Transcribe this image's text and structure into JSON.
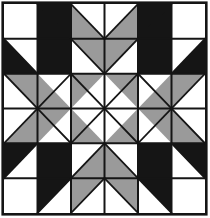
{
  "figure": {
    "kind": "geometric-quilt-block",
    "grid_rows": 6,
    "grid_cols": 6
  },
  "canvas": {
    "width": 210,
    "height": 218,
    "background": "#ffffff"
  },
  "palette": {
    "black": "#151515",
    "gray": "#9a9a9a",
    "white": "#ffffff",
    "line": "#151515"
  },
  "layout": {
    "origin_x": 4,
    "origin_y": 4,
    "block_width": 201,
    "block_height": 209,
    "cell_width": 33.5,
    "cell_height": 34.833,
    "outer_border_width": 2.6,
    "grid_line_width": 2.0,
    "diagonal_line_width": 1.8
  },
  "cells": [
    [
      {
        "name": "r0c0",
        "fill": "white",
        "shape": "solid"
      },
      {
        "name": "r0c1",
        "fill": "black",
        "shape": "half-tl-br",
        "primary": "black",
        "secondary": "white",
        "note": "diagonal top-left to bottom-right, black lower-left"
      },
      {
        "name": "r0c2",
        "fill": "gray",
        "shape": "half-tl-br",
        "primary": "gray",
        "secondary": "white",
        "note": "gray upper-left triangle"
      },
      {
        "name": "r0c3",
        "fill": "gray",
        "shape": "half-tr-bl",
        "primary": "gray",
        "secondary": "white",
        "note": "gray upper-right triangle"
      },
      {
        "name": "r0c4",
        "fill": "black",
        "shape": "half-tr-bl",
        "primary": "black",
        "secondary": "white",
        "note": "diagonal top-right to bottom-left, black lower-right"
      },
      {
        "name": "r0c5",
        "fill": "white",
        "shape": "solid"
      }
    ],
    [
      {
        "name": "r1c0",
        "fill": "black",
        "shape": "half-tl-br",
        "primary": "white",
        "secondary": "black",
        "note": "black lower-right triangle"
      },
      {
        "name": "r1c1",
        "fill": "black",
        "shape": "solid"
      },
      {
        "name": "r1c2",
        "fill": "white",
        "shape": "half-tr-bl",
        "primary": "white",
        "secondary": "gray",
        "note": "gray lower-right triangle"
      },
      {
        "name": "r1c3",
        "fill": "white",
        "shape": "half-tl-br",
        "primary": "white",
        "secondary": "gray",
        "note": "gray lower-left triangle"
      },
      {
        "name": "r1c4",
        "fill": "black",
        "shape": "solid"
      },
      {
        "name": "r1c5",
        "fill": "black",
        "shape": "half-tr-bl",
        "primary": "white",
        "secondary": "black",
        "note": "black lower-left triangle"
      }
    ],
    [
      {
        "name": "r2c0",
        "fill": "gray",
        "shape": "half-tl-br",
        "primary": "gray",
        "secondary": "white",
        "note": "gray upper-left triangle"
      },
      {
        "name": "r2c1",
        "fill": "gray",
        "shape": "half-tr-bl",
        "primary": "gray",
        "secondary": "white",
        "note": "gray upper-right and lower-left"
      },
      {
        "name": "r2c2",
        "fill": "white",
        "shape": "half-tr-bl",
        "primary": "gray",
        "secondary": "white",
        "note": "gray upper-left wedge"
      },
      {
        "name": "r2c3",
        "fill": "white",
        "shape": "half-tl-br",
        "primary": "gray",
        "secondary": "white",
        "note": "gray upper-right wedge"
      },
      {
        "name": "r2c4",
        "fill": "gray",
        "shape": "half-tl-br",
        "primary": "gray",
        "secondary": "white"
      },
      {
        "name": "r2c5",
        "fill": "gray",
        "shape": "half-tr-bl",
        "primary": "gray",
        "secondary": "white"
      }
    ],
    [
      {
        "name": "r3c0",
        "fill": "gray",
        "shape": "half-tr-bl",
        "primary": "gray",
        "secondary": "white"
      },
      {
        "name": "r3c1",
        "fill": "gray",
        "shape": "half-tl-br",
        "primary": "gray",
        "secondary": "white"
      },
      {
        "name": "r3c2",
        "fill": "white",
        "shape": "half-tl-br",
        "primary": "gray",
        "secondary": "white"
      },
      {
        "name": "r3c3",
        "fill": "white",
        "shape": "half-tr-bl",
        "primary": "gray",
        "secondary": "white"
      },
      {
        "name": "r3c4",
        "fill": "gray",
        "shape": "half-tr-bl",
        "primary": "gray",
        "secondary": "white"
      },
      {
        "name": "r3c5",
        "fill": "gray",
        "shape": "half-tl-br",
        "primary": "gray",
        "secondary": "white"
      }
    ],
    [
      {
        "name": "r4c0",
        "fill": "black",
        "shape": "half-tr-bl",
        "primary": "white",
        "secondary": "black"
      },
      {
        "name": "r4c1",
        "fill": "black",
        "shape": "solid"
      },
      {
        "name": "r4c2",
        "fill": "white",
        "shape": "half-tl-br",
        "primary": "white",
        "secondary": "gray"
      },
      {
        "name": "r4c3",
        "fill": "white",
        "shape": "half-tr-bl",
        "primary": "white",
        "secondary": "gray"
      },
      {
        "name": "r4c4",
        "fill": "black",
        "shape": "solid"
      },
      {
        "name": "r4c5",
        "fill": "black",
        "shape": "half-tl-br",
        "primary": "white",
        "secondary": "black"
      }
    ],
    [
      {
        "name": "r5c0",
        "fill": "white",
        "shape": "solid"
      },
      {
        "name": "r5c1",
        "fill": "black",
        "shape": "half-tr-bl",
        "primary": "black",
        "secondary": "white"
      },
      {
        "name": "r5c2",
        "fill": "gray",
        "shape": "half-tr-bl",
        "primary": "gray",
        "secondary": "white"
      },
      {
        "name": "r5c3",
        "fill": "gray",
        "shape": "half-tl-br",
        "primary": "gray",
        "secondary": "white"
      },
      {
        "name": "r5c4",
        "fill": "black",
        "shape": "half-tl-br",
        "primary": "black",
        "secondary": "white"
      },
      {
        "name": "r5c5",
        "fill": "white",
        "shape": "solid"
      }
    ]
  ],
  "shapes": {
    "note": "Explicit polygon list in block-local coordinates (0..6 cell units). Filled regions only; white is the background.",
    "black_regions": [
      {
        "name": "tl-star-arm-upper",
        "points": "1,0 2,0 2,1 1,1"
      },
      {
        "name": "tl-star-arm-upper-cut",
        "points": "1,0 2,1 1,1"
      },
      {
        "name": "tl-block-square",
        "points": "1,1 2,1 2,2 1,2"
      },
      {
        "name": "tl-star-arm-left",
        "points": "0,1 1,2 0,2"
      },
      {
        "name": "tr-star-arm-upper",
        "points": "4,0 5,0 5,1 4,1"
      },
      {
        "name": "tr-block-square",
        "points": "4,1 5,1 5,2 4,2"
      },
      {
        "name": "tr-star-arm-right",
        "points": "5,2 6,1 6,2"
      },
      {
        "name": "bl-star-arm-left",
        "points": "0,4 1,4 0,5"
      },
      {
        "name": "bl-block-square",
        "points": "1,4 2,4 2,5 1,5"
      },
      {
        "name": "bl-star-arm-lower",
        "points": "1,5 2,5 1,6"
      },
      {
        "name": "br-block-square",
        "points": "4,4 5,4 5,5 4,5"
      },
      {
        "name": "br-star-arm-right",
        "points": "5,4 6,4 6,5"
      },
      {
        "name": "br-star-arm-lower",
        "points": "4,5 5,5 5,6"
      }
    ],
    "gray_regions": [
      {
        "name": "top-center-left-wedge",
        "points": "2,0 3,1 2,1"
      },
      {
        "name": "top-center-right-wedge",
        "points": "4,0 4,1 3,1"
      },
      {
        "name": "top-center-diamond-lower",
        "points": "2,1 4,1 3,2"
      },
      {
        "name": "left-middle-upper-wedge",
        "points": "0,2 1,2 1,3"
      },
      {
        "name": "left-middle-lower-wedge",
        "points": "0,4 1,3 1,4"
      },
      {
        "name": "left-middle-diamond",
        "points": "1,2 2,3 1,4"
      },
      {
        "name": "right-middle-upper-wedge",
        "points": "6,2 5,2 5,3"
      },
      {
        "name": "right-middle-lower-wedge",
        "points": "6,4 5,3 5,4"
      },
      {
        "name": "right-middle-diamond",
        "points": "5,2 5,4 4,3"
      },
      {
        "name": "center-top-wedge",
        "points": "2,2 4,2 3,3"
      },
      {
        "name": "center-left-wedge",
        "points": "2,2 3,3 2,4"
      },
      {
        "name": "center-right-wedge",
        "points": "4,2 4,4 3,3"
      },
      {
        "name": "center-bottom-wedge",
        "points": "2,4 4,4 3,3"
      },
      {
        "name": "bottom-center-diamond-upper",
        "points": "2,5 3,4 4,5"
      },
      {
        "name": "bottom-center-left-wedge",
        "points": "2,5 3,5 2,6"
      },
      {
        "name": "bottom-center-right-wedge",
        "points": "3,5 4,5 4,6"
      }
    ],
    "white_regions": [
      {
        "name": "center-diamond",
        "points": "3,2 4,3 3,4 2,3"
      }
    ]
  },
  "grid_lines": {
    "vertical_units": [
      1,
      2,
      3,
      4,
      5
    ],
    "horizontal_units": [
      1,
      2,
      3,
      4,
      5
    ]
  },
  "diagonals": [
    {
      "name": "d-r0c1",
      "from": "1,0",
      "to": "2,1"
    },
    {
      "name": "d-r0c2",
      "from": "2,0",
      "to": "3,1"
    },
    {
      "name": "d-r0c3",
      "from": "4,0",
      "to": "3,1"
    },
    {
      "name": "d-r0c4",
      "from": "5,0",
      "to": "4,1"
    },
    {
      "name": "d-r1c0",
      "from": "0,1",
      "to": "1,2"
    },
    {
      "name": "d-r1c2",
      "from": "2,1",
      "to": "3,2"
    },
    {
      "name": "d-r1c3",
      "from": "4,1",
      "to": "3,2"
    },
    {
      "name": "d-r1c5",
      "from": "6,1",
      "to": "5,2"
    },
    {
      "name": "d-r2c0",
      "from": "0,2",
      "to": "1,3"
    },
    {
      "name": "d-r2c1",
      "from": "2,2",
      "to": "1,3"
    },
    {
      "name": "d-r2c2",
      "from": "2,2",
      "to": "3,3"
    },
    {
      "name": "d-r2c3",
      "from": "4,2",
      "to": "3,3"
    },
    {
      "name": "d-r2c4",
      "from": "4,2",
      "to": "5,3"
    },
    {
      "name": "d-r2c5",
      "from": "6,2",
      "to": "5,3"
    },
    {
      "name": "d-r3c0",
      "from": "0,4",
      "to": "1,3"
    },
    {
      "name": "d-r3c1",
      "from": "2,4",
      "to": "1,3"
    },
    {
      "name": "d-r3c2",
      "from": "2,4",
      "to": "3,3"
    },
    {
      "name": "d-r3c3",
      "from": "4,4",
      "to": "3,3"
    },
    {
      "name": "d-r3c4",
      "from": "4,4",
      "to": "5,3"
    },
    {
      "name": "d-r3c5",
      "from": "6,4",
      "to": "5,3"
    },
    {
      "name": "d-r4c0",
      "from": "0,5",
      "to": "1,4"
    },
    {
      "name": "d-r4c2",
      "from": "2,5",
      "to": "3,4"
    },
    {
      "name": "d-r4c3",
      "from": "4,5",
      "to": "3,4"
    },
    {
      "name": "d-r4c5",
      "from": "6,5",
      "to": "5,4"
    },
    {
      "name": "d-r5c1",
      "from": "1,6",
      "to": "2,5"
    },
    {
      "name": "d-r5c2",
      "from": "2,6",
      "to": "3,5"
    },
    {
      "name": "d-r5c3",
      "from": "4,6",
      "to": "3,5"
    },
    {
      "name": "d-r5c4",
      "from": "5,6",
      "to": "4,5"
    }
  ]
}
